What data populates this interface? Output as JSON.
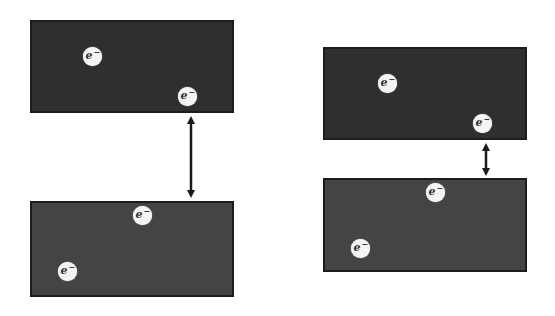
{
  "figure": {
    "colors": {
      "top_slab": "#2f2f2f",
      "bottom_slab": "#444444",
      "electron": "#f4f4f4",
      "arrow": "#1a1a1a"
    }
  },
  "left_pair": {
    "top_slab": {
      "x": 30,
      "y": 20,
      "w": 204,
      "h": 93,
      "electrons": [
        {
          "symbol": "e",
          "charge": "−",
          "x": 92,
          "y": 56
        },
        {
          "symbol": "e",
          "charge": "−",
          "x": 187,
          "y": 96
        }
      ]
    },
    "bottom_slab": {
      "x": 30,
      "y": 201,
      "w": 204,
      "h": 96,
      "electrons": [
        {
          "symbol": "e",
          "charge": "−",
          "x": 142,
          "y": 215
        },
        {
          "symbol": "e",
          "charge": "−",
          "x": 67,
          "y": 271
        }
      ]
    },
    "arrow": {
      "x": 191,
      "y1": 116,
      "y2": 198,
      "label": "separation-large"
    }
  },
  "right_pair": {
    "top_slab": {
      "x": 323,
      "y": 47,
      "w": 204,
      "h": 93,
      "electrons": [
        {
          "symbol": "e",
          "charge": "−",
          "x": 387,
          "y": 83
        },
        {
          "symbol": "e",
          "charge": "−",
          "x": 482,
          "y": 123
        }
      ]
    },
    "bottom_slab": {
      "x": 323,
      "y": 178,
      "w": 204,
      "h": 94,
      "electrons": [
        {
          "symbol": "e",
          "charge": "−",
          "x": 435,
          "y": 192
        },
        {
          "symbol": "e",
          "charge": "−",
          "x": 360,
          "y": 248
        }
      ]
    },
    "arrow": {
      "x": 486,
      "y1": 143,
      "y2": 176,
      "label": "separation-small"
    }
  }
}
